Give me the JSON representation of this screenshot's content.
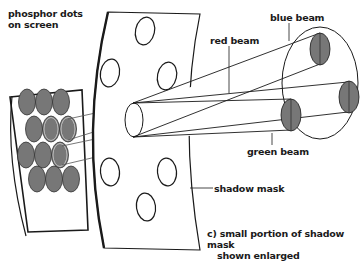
{
  "diagram": {
    "colors": {
      "line": "#1a1a1a",
      "dot_fill": "#777777",
      "background": "#ffffff"
    },
    "labels": {
      "phosphor_dots_line1": "phosphor dots",
      "phosphor_dots_line2": "on screen",
      "red_beam": "red beam",
      "blue_beam": "blue beam",
      "green_beam": "green beam",
      "shadow_mask": "shadow mask",
      "caption_line1": "c) small portion of shadow mask",
      "caption_line2": "shown enlarged"
    },
    "components": [
      {
        "name": "phosphor-screen",
        "description": "screen section with 13 grey phosphor dots in triangular arrangement"
      },
      {
        "name": "shadow-mask",
        "description": "curved plate with 6 elliptical holes"
      },
      {
        "name": "beam-bundle",
        "description": "three converging beams from electron guns"
      },
      {
        "name": "electron-guns",
        "description": "three grey ellipses arranged on a circle (blue top, red right, green left)"
      }
    ]
  }
}
